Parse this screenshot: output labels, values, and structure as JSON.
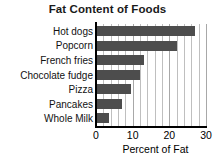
{
  "chart_data": {
    "type": "bar",
    "orientation": "horizontal",
    "title": "Fat Content of Foods",
    "xlabel": "Percent of Fat",
    "ylabel": "",
    "categories": [
      "Hot dogs",
      "Popcorn",
      "French fries",
      "Chocolate fudge",
      "Pizza",
      "Pancakes",
      "Whole Milk"
    ],
    "values": [
      27,
      22,
      13,
      12,
      9.5,
      7,
      3.5
    ],
    "xlim": [
      0,
      30
    ],
    "xticks": [
      0,
      10,
      20,
      30
    ],
    "xtick_labels": [
      "0",
      "10",
      "20",
      "30"
    ],
    "minor_tick_step": 2,
    "grid": true,
    "grid_axis": "x",
    "legend": false,
    "bar_color": "#4d4d4d",
    "grid_color": "#bfbfbf",
    "axis_color": "#000000",
    "title_color": "#1a1a1a",
    "background": "#ffffff"
  }
}
